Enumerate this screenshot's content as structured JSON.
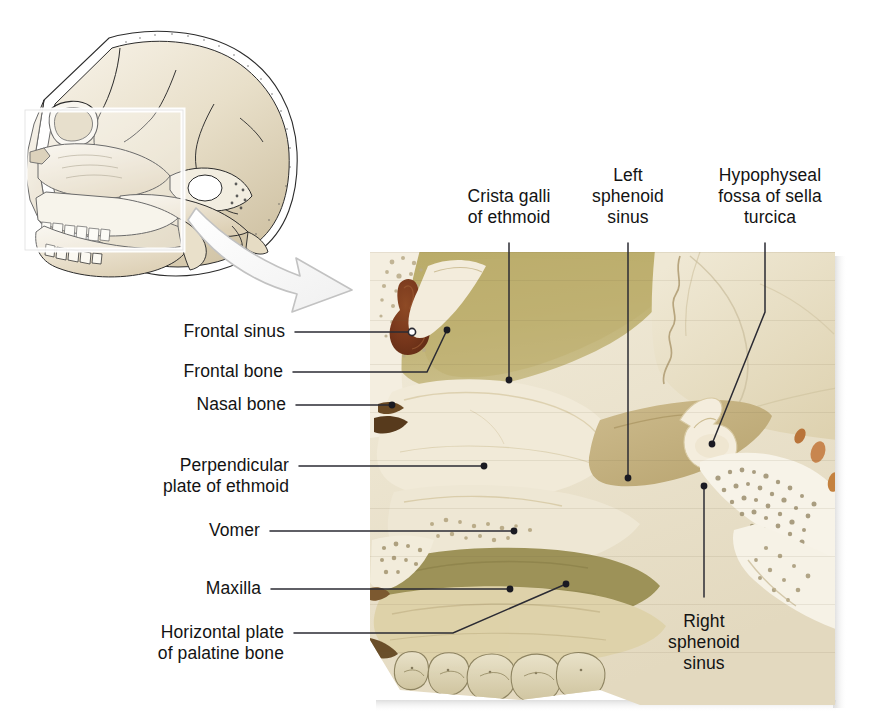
{
  "figure": {
    "kind": "anatomical-illustration",
    "background_color": "#ffffff",
    "leader_line_color": "#2b2b33",
    "label_text_color": "#131313"
  },
  "inset": {
    "name": "lateral-skull-line-drawing",
    "description": "Lateral view line drawing of a human skull with a highlighted rectangular region of interest over the face and sphenoid area",
    "highlight_box_color": "#ffffff",
    "arrow": {
      "name": "magnify-arrow",
      "description": "Curved outlined arrow pointing from the inset region of interest down-right toward the photograph",
      "fill": "#fbfbfb",
      "stroke": "#b9b9b9"
    }
  },
  "photo": {
    "name": "skull-sagittal-photograph",
    "description": "Photograph of a sagittally sectioned skull showing the frontal sinus, ethmoid, vomer, maxilla, palatine bone and sphenoid sinuses",
    "bone_light": "#efe7d2",
    "bone_mid": "#ded0ad",
    "bone_olive": "#b6a868",
    "bone_tan": "#c6b383",
    "sinus_cavity": "#7d3f21",
    "edge_shadow": "#d9d9d9"
  },
  "labels": [
    {
      "id": "crista-galli",
      "text": "Crista galli\nof ethmoid",
      "align": "center",
      "marker": "dot"
    },
    {
      "id": "left-sphenoid-sinus",
      "text": "Left\nsphenoid\nsinus",
      "align": "center",
      "marker": "dot"
    },
    {
      "id": "hypophyseal-fossa",
      "text": "Hypophyseal\nfossa of sella\nturcica",
      "align": "center",
      "marker": "dot"
    },
    {
      "id": "frontal-sinus",
      "text": "Frontal sinus",
      "align": "right",
      "marker": "circle"
    },
    {
      "id": "frontal-bone",
      "text": "Frontal bone",
      "align": "right",
      "marker": "dot"
    },
    {
      "id": "nasal-bone",
      "text": "Nasal bone",
      "align": "right",
      "marker": "dot"
    },
    {
      "id": "perpendicular-plate-of-ethmoid",
      "text": "Perpendicular\nplate of ethmoid",
      "align": "right",
      "marker": "dot"
    },
    {
      "id": "vomer",
      "text": "Vomer",
      "align": "right",
      "marker": "dot"
    },
    {
      "id": "maxilla",
      "text": "Maxilla",
      "align": "right",
      "marker": "dot"
    },
    {
      "id": "horizontal-plate-of-palatine-bone",
      "text": "Horizontal plate\nof palatine bone",
      "align": "right",
      "marker": "dot"
    },
    {
      "id": "right-sphenoid-sinus",
      "text": "Right\nsphenoid\nsinus",
      "align": "center",
      "marker": "dot"
    }
  ]
}
